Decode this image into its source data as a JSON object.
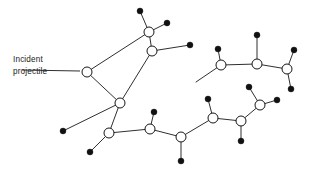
{
  "figure": {
    "background_color": "#ffffff",
    "line_color": "#171717",
    "node_fill_open": "#ffffff",
    "node_fill_solid": "#111111",
    "canvas": {
      "width": 314,
      "height": 178
    }
  },
  "annotation": {
    "label_line1": "Incident",
    "label_line2": "projectile",
    "label_x": 13,
    "label_y1": 62,
    "label_y2": 74,
    "leader": {
      "x1": 22,
      "y1": 70,
      "x2": 80,
      "y2": 71
    }
  },
  "open_nodes": [
    {
      "id": "n1",
      "name": "node-incident-impact",
      "cx": 87,
      "cy": 72,
      "r": 5.0
    },
    {
      "id": "n2",
      "name": "node-upper-chain-a",
      "cx": 149,
      "cy": 32,
      "r": 5.0
    },
    {
      "id": "n3",
      "name": "node-upper-chain-b",
      "cx": 152,
      "cy": 51,
      "r": 5.0
    },
    {
      "id": "n4",
      "name": "node-mid-left",
      "cx": 120,
      "cy": 103,
      "r": 5.0
    },
    {
      "id": "n5",
      "name": "node-upper-right-a",
      "cx": 221,
      "cy": 65,
      "r": 5.0
    },
    {
      "id": "n6",
      "name": "node-upper-right-b",
      "cx": 257,
      "cy": 64,
      "r": 5.0
    },
    {
      "id": "n7",
      "name": "node-upper-right-c",
      "cx": 287,
      "cy": 69,
      "r": 5.0
    },
    {
      "id": "n8",
      "name": "node-lower-left",
      "cx": 109,
      "cy": 133,
      "r": 5.0
    },
    {
      "id": "n9",
      "name": "node-lower-mid-a",
      "cx": 150,
      "cy": 129,
      "r": 5.0
    },
    {
      "id": "n10",
      "name": "node-lower-mid-b",
      "cx": 181,
      "cy": 137,
      "r": 5.0
    },
    {
      "id": "n11",
      "name": "node-lower-right-a",
      "cx": 213,
      "cy": 118,
      "r": 5.0
    },
    {
      "id": "n12",
      "name": "node-lower-right-b",
      "cx": 241,
      "cy": 121,
      "r": 5.0
    },
    {
      "id": "n13",
      "name": "node-lower-right-c",
      "cx": 260,
      "cy": 105,
      "r": 5.0
    }
  ],
  "solid_nodes": [
    {
      "name": "dot-top-apex",
      "cx": 140,
      "cy": 11,
      "r": 3.0
    },
    {
      "name": "dot-upper-right-arm",
      "cx": 167,
      "cy": 23,
      "r": 3.0
    },
    {
      "name": "dot-mid-branch",
      "cx": 190,
      "cy": 45,
      "r": 3.0
    },
    {
      "name": "dot-above-right-a",
      "cx": 218,
      "cy": 49,
      "r": 3.0
    },
    {
      "name": "dot-above-right-b",
      "cx": 257,
      "cy": 35,
      "r": 3.0
    },
    {
      "name": "dot-above-right-c",
      "cx": 294,
      "cy": 50,
      "r": 3.0
    },
    {
      "name": "dot-right-tail",
      "cx": 291,
      "cy": 89,
      "r": 3.0
    },
    {
      "name": "dot-left-lower",
      "cx": 90,
      "cy": 152,
      "r": 3.0
    },
    {
      "name": "dot-mid-lower-a",
      "cx": 154,
      "cy": 112,
      "r": 3.0
    },
    {
      "name": "dot-mid-lower-b",
      "cx": 181,
      "cy": 161,
      "r": 3.0
    },
    {
      "name": "dot-lower-right-up",
      "cx": 208,
      "cy": 99,
      "r": 3.0
    },
    {
      "name": "dot-lower-right-dn",
      "cx": 241,
      "cy": 141,
      "r": 3.0
    },
    {
      "name": "dot-lower-right-arm",
      "cx": 249,
      "cy": 87,
      "r": 3.0
    },
    {
      "name": "dot-right-branch",
      "cx": 277,
      "cy": 100,
      "r": 3.0
    },
    {
      "name": "dot-far-left-lower",
      "cx": 63,
      "cy": 131,
      "r": 3.0
    }
  ],
  "edges": [
    {
      "name": "edge-impact-to-upper",
      "x1": 87,
      "y1": 72,
      "x2": 149,
      "y2": 32
    },
    {
      "name": "edge-impact-to-midleft",
      "x1": 87,
      "y1": 72,
      "x2": 120,
      "y2": 103
    },
    {
      "name": "edge-upperA-to-apex",
      "x1": 149,
      "y1": 32,
      "x2": 140,
      "y2": 11
    },
    {
      "name": "edge-upperA-to-arm",
      "x1": 149,
      "y1": 32,
      "x2": 167,
      "y2": 23
    },
    {
      "name": "edge-upperA-to-upperB",
      "x1": 149,
      "y1": 32,
      "x2": 152,
      "y2": 51
    },
    {
      "name": "edge-upperB-to-branch",
      "x1": 152,
      "y1": 51,
      "x2": 190,
      "y2": 45
    },
    {
      "name": "edge-upperB-to-midleft",
      "x1": 152,
      "y1": 51,
      "x2": 120,
      "y2": 103
    },
    {
      "name": "edge-midleft-to-lowerL",
      "x1": 120,
      "y1": 103,
      "x2": 109,
      "y2": 133
    },
    {
      "name": "edge-midleft-to-dotleft",
      "x1": 120,
      "y1": 103,
      "x2": 63,
      "y2": 131
    },
    {
      "name": "edge-lowerL-to-dot",
      "x1": 109,
      "y1": 133,
      "x2": 90,
      "y2": 152
    },
    {
      "name": "edge-lowerL-to-lowmidA",
      "x1": 109,
      "y1": 133,
      "x2": 150,
      "y2": 129
    },
    {
      "name": "edge-lowmidA-to-dotup",
      "x1": 150,
      "y1": 129,
      "x2": 154,
      "y2": 112
    },
    {
      "name": "edge-lowmidA-to-lowmidB",
      "x1": 150,
      "y1": 129,
      "x2": 181,
      "y2": 137
    },
    {
      "name": "edge-lowmidB-to-dotdn",
      "x1": 181,
      "y1": 137,
      "x2": 181,
      "y2": 161
    },
    {
      "name": "edge-lowmidB-to-lowrtA",
      "x1": 181,
      "y1": 137,
      "x2": 213,
      "y2": 118
    },
    {
      "name": "edge-lowrtA-to-dotup",
      "x1": 213,
      "y1": 118,
      "x2": 208,
      "y2": 99
    },
    {
      "name": "edge-lowrtA-to-lowrtB",
      "x1": 213,
      "y1": 118,
      "x2": 241,
      "y2": 121
    },
    {
      "name": "edge-lowrtB-to-dotdn",
      "x1": 241,
      "y1": 121,
      "x2": 241,
      "y2": 141
    },
    {
      "name": "edge-lowrtB-to-lowrtC",
      "x1": 241,
      "y1": 121,
      "x2": 260,
      "y2": 105
    },
    {
      "name": "edge-lowrtC-to-arm",
      "x1": 260,
      "y1": 105,
      "x2": 249,
      "y2": 87
    },
    {
      "name": "edge-lowrtC-to-branch",
      "x1": 260,
      "y1": 105,
      "x2": 277,
      "y2": 100
    },
    {
      "name": "edge-upperA2-to-dotright",
      "x1": 221,
      "y1": 65,
      "x2": 218,
      "y2": 49
    },
    {
      "name": "edge-upperA2-to-upperB2",
      "x1": 221,
      "y1": 65,
      "x2": 257,
      "y2": 64
    },
    {
      "name": "edge-upperA2-to-lowrtA",
      "x1": 221,
      "y1": 65,
      "x2": 196,
      "y2": 82
    },
    {
      "name": "edge-upperB2-to-dotup",
      "x1": 257,
      "y1": 64,
      "x2": 257,
      "y2": 35
    },
    {
      "name": "edge-upperB2-to-upperC2",
      "x1": 257,
      "y1": 64,
      "x2": 287,
      "y2": 69
    },
    {
      "name": "edge-upperC2-to-dotup",
      "x1": 287,
      "y1": 69,
      "x2": 294,
      "y2": 50
    },
    {
      "name": "edge-upperC2-to-dottail",
      "x1": 287,
      "y1": 69,
      "x2": 291,
      "y2": 89
    }
  ]
}
